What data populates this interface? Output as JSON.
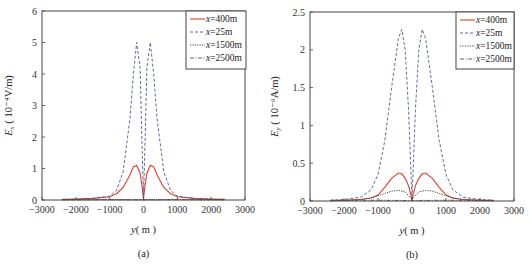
{
  "chart_data": [
    {
      "type": "line",
      "panel_label": "(a)",
      "title": "",
      "xlabel": "y (m)",
      "ylabel": "E_x (10^-4 V/m)",
      "xlim": [
        -3000,
        3000
      ],
      "ylim": [
        0,
        6
      ],
      "xticks": [
        "-3000",
        "-2000",
        "-1000",
        "0",
        "1000",
        "2000",
        "3000"
      ],
      "yticks": [
        "0",
        "1",
        "2",
        "3",
        "4",
        "5",
        "6"
      ],
      "legend_position": "upper right",
      "grid": false,
      "series": [
        {
          "name": "x=400m",
          "style": "solid",
          "color": "#e0402a",
          "x": [
            -2400,
            -2000,
            -1500,
            -1000,
            -800,
            -600,
            -400,
            -300,
            -200,
            -100,
            -50,
            0,
            50,
            100,
            200,
            300,
            400,
            600,
            800,
            1000,
            1500,
            2000,
            2400
          ],
          "y": [
            0.02,
            0.03,
            0.05,
            0.1,
            0.2,
            0.4,
            0.8,
            1.05,
            1.1,
            0.85,
            0.5,
            0.05,
            0.5,
            0.85,
            1.1,
            1.05,
            0.8,
            0.4,
            0.2,
            0.1,
            0.05,
            0.03,
            0.02
          ]
        },
        {
          "name": "x=25m",
          "style": "dashed",
          "color": "#4a5a9a",
          "x": [
            -2400,
            -2000,
            -1500,
            -1000,
            -800,
            -600,
            -400,
            -300,
            -200,
            -100,
            -50,
            0,
            50,
            100,
            200,
            300,
            400,
            600,
            800,
            1000,
            1500,
            2000,
            2400
          ],
          "y": [
            0.01,
            0.02,
            0.05,
            0.12,
            0.3,
            0.9,
            2.6,
            4.0,
            5.0,
            4.2,
            2.0,
            0.05,
            2.0,
            4.2,
            5.0,
            4.0,
            2.6,
            0.9,
            0.3,
            0.12,
            0.05,
            0.02,
            0.01
          ]
        },
        {
          "name": "x=1500m",
          "style": "dotted",
          "color": "#333333",
          "x": [
            -2400,
            -1000,
            0,
            1000,
            2400
          ],
          "y": [
            0.01,
            0.02,
            0.01,
            0.02,
            0.01
          ]
        },
        {
          "name": "x=2500m",
          "style": "dash-dot",
          "color": "#555555",
          "x": [
            -2400,
            -1000,
            0,
            1000,
            2400
          ],
          "y": [
            0.005,
            0.01,
            0.005,
            0.01,
            0.005
          ]
        }
      ]
    },
    {
      "type": "line",
      "panel_label": "(b)",
      "title": "",
      "xlabel": "y (m)",
      "ylabel": "E_y (10^-6 A/m)",
      "xlim": [
        -3000,
        3000
      ],
      "ylim": [
        0,
        2.5
      ],
      "xticks": [
        "-3000",
        "-2000",
        "-1000",
        "0",
        "1000",
        "2000",
        "3000"
      ],
      "yticks": [
        "0",
        "0.5",
        "1",
        "1.5",
        "2",
        "2.5"
      ],
      "legend_position": "upper right",
      "grid": false,
      "series": [
        {
          "name": "x=400m",
          "style": "solid",
          "color": "#e0402a",
          "x": [
            -2400,
            -2000,
            -1500,
            -1200,
            -1000,
            -800,
            -600,
            -400,
            -300,
            -200,
            -100,
            0,
            100,
            200,
            300,
            400,
            600,
            800,
            1000,
            1200,
            1500,
            2000,
            2400
          ],
          "y": [
            0.01,
            0.01,
            0.02,
            0.04,
            0.08,
            0.18,
            0.3,
            0.37,
            0.36,
            0.3,
            0.2,
            0.02,
            0.2,
            0.3,
            0.36,
            0.37,
            0.3,
            0.18,
            0.08,
            0.04,
            0.02,
            0.01,
            0.01
          ]
        },
        {
          "name": "x=25m",
          "style": "dashed",
          "color": "#4a5a9a",
          "x": [
            -2400,
            -2000,
            -1500,
            -1200,
            -1000,
            -800,
            -600,
            -400,
            -300,
            -200,
            -100,
            -50,
            0,
            50,
            100,
            200,
            300,
            400,
            600,
            800,
            1000,
            1200,
            1500,
            2000,
            2400
          ],
          "y": [
            0.01,
            0.02,
            0.05,
            0.15,
            0.35,
            0.8,
            1.5,
            2.15,
            2.27,
            2.0,
            1.2,
            0.6,
            0.02,
            0.6,
            1.2,
            2.0,
            2.27,
            2.15,
            1.5,
            0.8,
            0.35,
            0.15,
            0.05,
            0.02,
            0.01
          ]
        },
        {
          "name": "x=1500m",
          "style": "dotted",
          "color": "#333333",
          "x": [
            -2400,
            -2000,
            -1500,
            -1200,
            -1000,
            -800,
            -600,
            -400,
            -200,
            0,
            200,
            400,
            600,
            800,
            1000,
            1200,
            1500,
            2000,
            2400
          ],
          "y": [
            0.0,
            0.01,
            0.02,
            0.04,
            0.07,
            0.1,
            0.13,
            0.14,
            0.12,
            0.02,
            0.12,
            0.14,
            0.13,
            0.1,
            0.07,
            0.04,
            0.02,
            0.01,
            0.0
          ]
        },
        {
          "name": "x=2500m",
          "style": "dash-dot",
          "color": "#555555",
          "x": [
            -2400,
            -1000,
            0,
            1000,
            2400
          ],
          "y": [
            0.005,
            0.01,
            0.005,
            0.01,
            0.005
          ]
        }
      ]
    }
  ],
  "panels": [
    {
      "caption": "(a)",
      "xlabel_var": "y",
      "xlabel_unit": "( m )",
      "ylabel_var": "E",
      "ylabel_sub": "x",
      "ylabel_unit": "( 10⁻⁴V/m)"
    },
    {
      "caption": "(b)",
      "xlabel_var": "y",
      "xlabel_unit": "( m )",
      "ylabel_var": "E",
      "ylabel_sub": "y",
      "ylabel_unit": "( 10⁻⁶A/m)"
    }
  ]
}
